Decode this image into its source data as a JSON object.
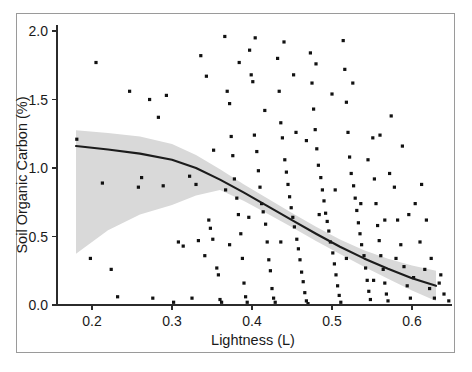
{
  "chart_data": {
    "type": "scatter",
    "title": "",
    "xlabel": "Lightness (L)",
    "ylabel": "Soil Organic Carbon (%)",
    "xlim": [
      0.165,
      0.655
    ],
    "ylim": [
      -0.06,
      2.08
    ],
    "xticks": [
      0.2,
      0.3,
      0.4,
      0.5,
      0.6
    ],
    "xticklabels": [
      "0.2",
      "0.3",
      "0.4",
      "0.5",
      "0.6"
    ],
    "yticks": [
      0.0,
      0.5,
      1.0,
      1.5,
      2.0
    ],
    "yticklabels": [
      "0.0",
      "0.5",
      "1.0",
      "1.5",
      "2.0"
    ],
    "grid": false,
    "legend": false,
    "point_color": "#111111",
    "line_color": "#1c1c1c",
    "band_color": "#d9d9d9",
    "series": [
      {
        "name": "Observations",
        "marker": "square",
        "points": [
          [
            0.181,
            1.21
          ],
          [
            0.198,
            0.34
          ],
          [
            0.205,
            1.77
          ],
          [
            0.213,
            0.89
          ],
          [
            0.224,
            0.26
          ],
          [
            0.232,
            0.06
          ],
          [
            0.247,
            1.56
          ],
          [
            0.258,
            0.86
          ],
          [
            0.262,
            0.93
          ],
          [
            0.272,
            1.5
          ],
          [
            0.276,
            0.05
          ],
          [
            0.283,
            1.37
          ],
          [
            0.293,
            1.53
          ],
          [
            0.302,
            0.02
          ],
          [
            0.314,
            0.43
          ],
          [
            0.322,
            0.94
          ],
          [
            0.333,
            0.47
          ],
          [
            0.341,
            0.36
          ],
          [
            0.346,
            0.62
          ],
          [
            0.348,
            0.56
          ],
          [
            0.351,
            0.48
          ],
          [
            0.356,
            0.27
          ],
          [
            0.358,
            0.22
          ],
          [
            0.36,
            0.04
          ],
          [
            0.362,
            0.02
          ],
          [
            0.366,
            1.96
          ],
          [
            0.369,
            1.56
          ],
          [
            0.372,
            1.47
          ],
          [
            0.374,
            1.23
          ],
          [
            0.376,
            1.09
          ],
          [
            0.378,
            0.92
          ],
          [
            0.381,
            0.78
          ],
          [
            0.383,
            0.66
          ],
          [
            0.386,
            0.52
          ],
          [
            0.388,
            0.34
          ],
          [
            0.39,
            0.16
          ],
          [
            0.392,
            0.06
          ],
          [
            0.394,
            0.02
          ],
          [
            0.397,
            1.86
          ],
          [
            0.399,
            1.68
          ],
          [
            0.401,
            1.63
          ],
          [
            0.403,
            1.24
          ],
          [
            0.406,
            1.12
          ],
          [
            0.408,
            0.98
          ],
          [
            0.41,
            0.86
          ],
          [
            0.412,
            0.74
          ],
          [
            0.414,
            0.68
          ],
          [
            0.417,
            0.59
          ],
          [
            0.419,
            0.46
          ],
          [
            0.421,
            0.33
          ],
          [
            0.423,
            0.25
          ],
          [
            0.425,
            0.12
          ],
          [
            0.427,
            0.05
          ],
          [
            0.429,
            0.02
          ],
          [
            0.432,
            1.8
          ],
          [
            0.434,
            1.56
          ],
          [
            0.436,
            1.33
          ],
          [
            0.438,
            1.22
          ],
          [
            0.441,
            1.06
          ],
          [
            0.443,
            0.97
          ],
          [
            0.445,
            0.88
          ],
          [
            0.447,
            0.79
          ],
          [
            0.449,
            0.71
          ],
          [
            0.451,
            0.64
          ],
          [
            0.453,
            0.57
          ],
          [
            0.456,
            0.48
          ],
          [
            0.458,
            0.41
          ],
          [
            0.46,
            0.33
          ],
          [
            0.462,
            0.24
          ],
          [
            0.464,
            0.17
          ],
          [
            0.466,
            0.09
          ],
          [
            0.468,
            0.03
          ],
          [
            0.47,
            0.01
          ],
          [
            0.473,
            1.84
          ],
          [
            0.475,
            1.62
          ],
          [
            0.477,
            1.43
          ],
          [
            0.479,
            1.28
          ],
          [
            0.481,
            1.14
          ],
          [
            0.483,
            1.02
          ],
          [
            0.486,
            0.93
          ],
          [
            0.488,
            0.84
          ],
          [
            0.49,
            0.76
          ],
          [
            0.492,
            0.67
          ],
          [
            0.494,
            0.61
          ],
          [
            0.496,
            0.54
          ],
          [
            0.498,
            0.46
          ],
          [
            0.501,
            0.38
          ],
          [
            0.503,
            0.3
          ],
          [
            0.505,
            0.22
          ],
          [
            0.507,
            0.14
          ],
          [
            0.509,
            0.07
          ],
          [
            0.511,
            0.02
          ],
          [
            0.514,
            1.93
          ],
          [
            0.516,
            1.72
          ],
          [
            0.518,
            1.48
          ],
          [
            0.52,
            1.26
          ],
          [
            0.522,
            1.08
          ],
          [
            0.524,
            0.96
          ],
          [
            0.527,
            0.87
          ],
          [
            0.529,
            0.78
          ],
          [
            0.531,
            0.69
          ],
          [
            0.533,
            0.6
          ],
          [
            0.535,
            0.52
          ],
          [
            0.537,
            0.44
          ],
          [
            0.54,
            0.36
          ],
          [
            0.542,
            0.27
          ],
          [
            0.544,
            0.18
          ],
          [
            0.546,
            0.1
          ],
          [
            0.548,
            0.04
          ],
          [
            0.551,
            1.22
          ],
          [
            0.553,
            0.92
          ],
          [
            0.555,
            0.74
          ],
          [
            0.557,
            0.58
          ],
          [
            0.559,
            0.47
          ],
          [
            0.561,
            0.36
          ],
          [
            0.564,
            0.26
          ],
          [
            0.566,
            0.16
          ],
          [
            0.568,
            0.08
          ],
          [
            0.57,
            0.03
          ],
          [
            0.574,
            1.38
          ],
          [
            0.578,
            0.86
          ],
          [
            0.582,
            0.62
          ],
          [
            0.586,
            0.44
          ],
          [
            0.59,
            0.28
          ],
          [
            0.594,
            0.14
          ],
          [
            0.598,
            0.05
          ],
          [
            0.604,
            0.74
          ],
          [
            0.61,
            0.46
          ],
          [
            0.616,
            0.26
          ],
          [
            0.622,
            0.12
          ],
          [
            0.628,
            0.05
          ],
          [
            0.634,
            0.16
          ],
          [
            0.64,
            0.08
          ],
          [
            0.646,
            0.03
          ],
          [
            0.336,
            1.82
          ],
          [
            0.343,
            1.67
          ],
          [
            0.33,
            0.88
          ],
          [
            0.325,
            0.05
          ],
          [
            0.308,
            0.46
          ],
          [
            0.289,
            0.87
          ],
          [
            0.367,
            0.84
          ],
          [
            0.384,
            1.77
          ],
          [
            0.404,
            1.95
          ],
          [
            0.44,
            1.92
          ],
          [
            0.455,
            1.26
          ],
          [
            0.48,
            1.76
          ],
          [
            0.5,
            1.54
          ],
          [
            0.526,
            1.62
          ],
          [
            0.545,
            1.06
          ],
          [
            0.56,
            1.24
          ],
          [
            0.572,
            0.96
          ],
          [
            0.588,
            1.16
          ],
          [
            0.596,
            0.66
          ],
          [
            0.612,
            0.88
          ],
          [
            0.624,
            0.34
          ],
          [
            0.636,
            0.22
          ],
          [
            0.352,
            1.13
          ],
          [
            0.372,
            0.44
          ],
          [
            0.396,
            0.64
          ],
          [
            0.416,
            1.42
          ],
          [
            0.436,
            0.46
          ],
          [
            0.452,
            1.68
          ],
          [
            0.468,
            1.2
          ],
          [
            0.484,
            0.66
          ],
          [
            0.504,
            0.84
          ],
          [
            0.518,
            0.34
          ],
          [
            0.536,
            0.74
          ],
          [
            0.552,
            0.18
          ],
          [
            0.566,
            0.62
          ],
          [
            0.58,
            0.34
          ],
          [
            0.602,
            0.2
          ],
          [
            0.618,
            0.62
          ]
        ]
      }
    ],
    "fit_curve": {
      "name": "Loess fit",
      "x": [
        0.18,
        0.22,
        0.26,
        0.3,
        0.33,
        0.36,
        0.39,
        0.42,
        0.45,
        0.48,
        0.51,
        0.54,
        0.57,
        0.6,
        0.63
      ],
      "y": [
        1.16,
        1.135,
        1.105,
        1.06,
        1.0,
        0.915,
        0.82,
        0.72,
        0.62,
        0.52,
        0.425,
        0.34,
        0.265,
        0.195,
        0.14
      ]
    },
    "confidence_band": {
      "name": "95% confidence band",
      "x": [
        0.18,
        0.22,
        0.26,
        0.3,
        0.33,
        0.36,
        0.39,
        0.42,
        0.45,
        0.48,
        0.51,
        0.54,
        0.57,
        0.6,
        0.63
      ],
      "upper": [
        1.275,
        1.255,
        1.23,
        1.175,
        1.095,
        0.99,
        0.88,
        0.775,
        0.672,
        0.572,
        0.478,
        0.4,
        0.338,
        0.288,
        0.25
      ],
      "lower": [
        0.375,
        0.545,
        0.66,
        0.73,
        0.8,
        0.84,
        0.76,
        0.665,
        0.568,
        0.468,
        0.372,
        0.28,
        0.192,
        0.105,
        0.03
      ]
    }
  }
}
